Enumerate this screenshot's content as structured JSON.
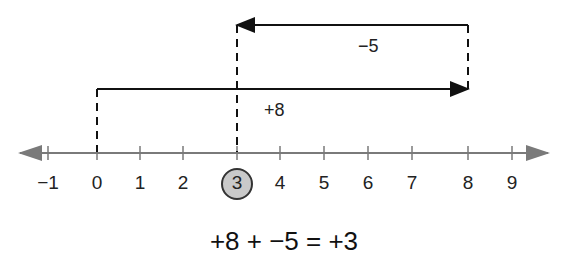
{
  "number_line": {
    "ticks": [
      "−1",
      "0",
      "1",
      "2",
      "3",
      "4",
      "5",
      "6",
      "7",
      "8",
      "9"
    ],
    "tick_x": [
      48,
      97,
      140,
      183,
      237,
      280,
      324,
      368,
      412,
      468,
      512
    ],
    "highlighted_value": "3",
    "axis_color": "#7a7a7a",
    "highlight_fill": "#c9c9c9"
  },
  "arrows": {
    "first": {
      "label": "+8",
      "from": 0,
      "to": 8
    },
    "second": {
      "label": "−5",
      "from": 8,
      "to": 3
    }
  },
  "equation": "+8 + −5 = +3"
}
